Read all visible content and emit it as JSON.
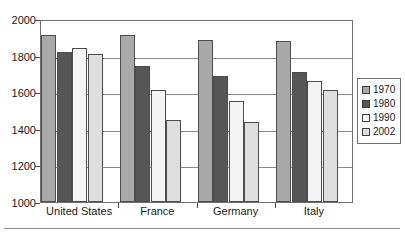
{
  "chart_data": {
    "type": "bar",
    "title": "",
    "xlabel": "",
    "ylabel": "",
    "categories": [
      "United States",
      "France",
      "Germany",
      "Italy"
    ],
    "series": [
      {
        "name": "1970",
        "color": "#a9a9a9",
        "values": [
          1915,
          1910,
          1885,
          1880
        ]
      },
      {
        "name": "1980",
        "color": "#565656",
        "values": [
          1820,
          1745,
          1690,
          1710
        ]
      },
      {
        "name": "1990",
        "color": "#f4f4f4",
        "values": [
          1840,
          1610,
          1550,
          1660
        ]
      },
      {
        "name": "2002",
        "color": "#dedede",
        "values": [
          1810,
          1450,
          1435,
          1610
        ]
      }
    ],
    "ylim": [
      1000,
      2000
    ],
    "yticks": [
      1000,
      1200,
      1400,
      1600,
      1800,
      2000
    ],
    "ytick_labels": [
      "1000",
      "1200",
      "1400",
      "1600",
      "1800",
      "2000"
    ],
    "grid": true,
    "legend_position": "right"
  },
  "legend": {
    "entries": [
      {
        "label": "1970"
      },
      {
        "label": "1980"
      },
      {
        "label": "1990"
      },
      {
        "label": "2002"
      }
    ]
  }
}
